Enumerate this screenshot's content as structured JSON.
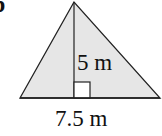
{
  "problem_label": "b",
  "figure": {
    "shape": "triangle",
    "fill_color": "#e6e6e6",
    "stroke_color": "#222222",
    "right_angle_marker_fill": "#ffffff",
    "height": {
      "value": 5,
      "unit": "m",
      "text": "5 m"
    },
    "base": {
      "value": 7.5,
      "unit": "m",
      "text": "7.5 m"
    }
  }
}
